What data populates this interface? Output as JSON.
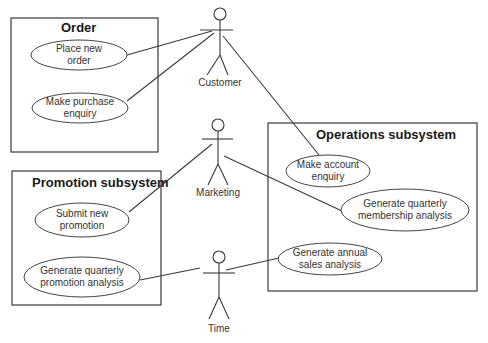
{
  "diagram": {
    "type": "UML use case diagram",
    "subsystems": [
      {
        "id": "order",
        "title": "Order",
        "use_cases": [
          "place_new_order",
          "make_purchase_enquiry"
        ]
      },
      {
        "id": "promotion",
        "title": "Promotion subsystem",
        "use_cases": [
          "submit_new_promotion",
          "generate_quarterly_promotion_analysis"
        ]
      },
      {
        "id": "operations",
        "title": "Operations subsystem",
        "use_cases": [
          "make_account_enquiry",
          "generate_quarterly_membership_analysis",
          "generate_annual_sales_analysis"
        ]
      }
    ],
    "use_cases": {
      "place_new_order": {
        "line1": "Place new",
        "line2": "order"
      },
      "make_purchase_enquiry": {
        "line1": "Make purchase",
        "line2": "enquiry"
      },
      "submit_new_promotion": {
        "line1": "Submit new",
        "line2": "promotion"
      },
      "generate_quarterly_promotion_analysis": {
        "line1": "Generate quarterly",
        "line2": "promotion analysis"
      },
      "make_account_enquiry": {
        "line1": "Make account",
        "line2": "enquiry"
      },
      "generate_quarterly_membership_analysis": {
        "line1": "Generate quarterly",
        "line2": "membership analysis"
      },
      "generate_annual_sales_analysis": {
        "line1": "Generate annual",
        "line2": "sales analysis"
      }
    },
    "actors": {
      "customer": {
        "label": "Customer"
      },
      "marketing": {
        "label": "Marketing"
      },
      "time": {
        "label": "Time"
      }
    },
    "associations": [
      [
        "customer",
        "place_new_order"
      ],
      [
        "customer",
        "make_purchase_enquiry"
      ],
      [
        "customer",
        "make_account_enquiry"
      ],
      [
        "marketing",
        "submit_new_promotion"
      ],
      [
        "marketing",
        "generate_quarterly_membership_analysis"
      ],
      [
        "time",
        "generate_quarterly_promotion_analysis"
      ],
      [
        "time",
        "generate_annual_sales_analysis"
      ]
    ]
  }
}
